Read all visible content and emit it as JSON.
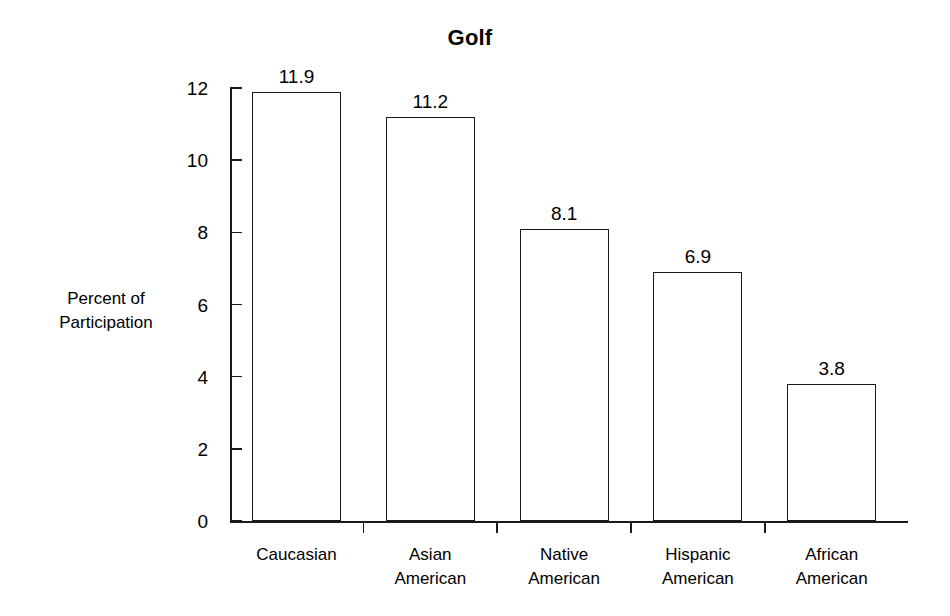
{
  "chart_data": {
    "type": "bar",
    "title": "Golf",
    "xlabel": "",
    "ylabel": "Percent of\nParticipation",
    "ylim": [
      0,
      12
    ],
    "yticks": [
      0,
      2,
      4,
      6,
      8,
      10,
      12
    ],
    "ytick_labels": [
      "0",
      "2",
      "4",
      "6",
      "8",
      "10",
      "12"
    ],
    "grid": false,
    "legend": false,
    "orientation": "vertical",
    "bar_style": {
      "fill": "#ffffff",
      "edge": "#1a1a1a"
    },
    "categories": [
      "Caucasian",
      "Asian\nAmerican",
      "Native\nAmerican",
      "Hispanic\nAmerican",
      "African\nAmerican"
    ],
    "values": [
      11.9,
      11.2,
      8.1,
      6.9,
      3.8
    ],
    "value_labels": [
      "11.9",
      "11.2",
      "8.1",
      "6.9",
      "3.8"
    ],
    "series": [
      {
        "name": "Percent of Participation",
        "values": [
          11.9,
          11.2,
          8.1,
          6.9,
          3.8
        ]
      }
    ]
  },
  "colors": {
    "background": "#ffffff",
    "ink": "#1a1a1a"
  }
}
